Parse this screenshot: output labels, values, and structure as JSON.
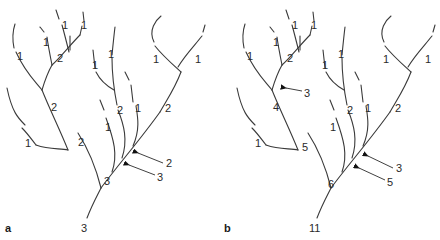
{
  "figure": {
    "panels": [
      {
        "id": "a",
        "label": "a",
        "scheme": "Strahler",
        "segment_labels": {
          "upper_left_tips": [
            "1",
            "1",
            "1",
            "1"
          ],
          "upper_left_junction": "2",
          "upper_left_trunk": "2",
          "left_side_1": "1",
          "left_trunk": "2",
          "mid_tips": [
            "1",
            "1",
            "2",
            "1",
            "1"
          ],
          "right_tips": [
            "1",
            "1"
          ],
          "right_junction": "2",
          "main_trunk": "3",
          "outlet": "3"
        },
        "arrows": [
          {
            "label": "2"
          },
          {
            "label": "3"
          }
        ]
      },
      {
        "id": "b",
        "label": "b",
        "scheme": "Shreve",
        "segment_labels": {
          "upper_left_tips": [
            "1",
            "1",
            "1",
            "1"
          ],
          "upper_left_junction": "2",
          "upper_left_trunk": "4",
          "left_side_1": "1",
          "left_trunk": "5",
          "mid_tips": [
            "1",
            "1",
            "2",
            "1",
            "1"
          ],
          "right_tips": [
            "1",
            "1"
          ],
          "right_junction": "2",
          "main_trunk": "6",
          "outlet": "11"
        },
        "arrows": [
          {
            "label": "3"
          },
          {
            "label": "5"
          }
        ]
      }
    ]
  }
}
